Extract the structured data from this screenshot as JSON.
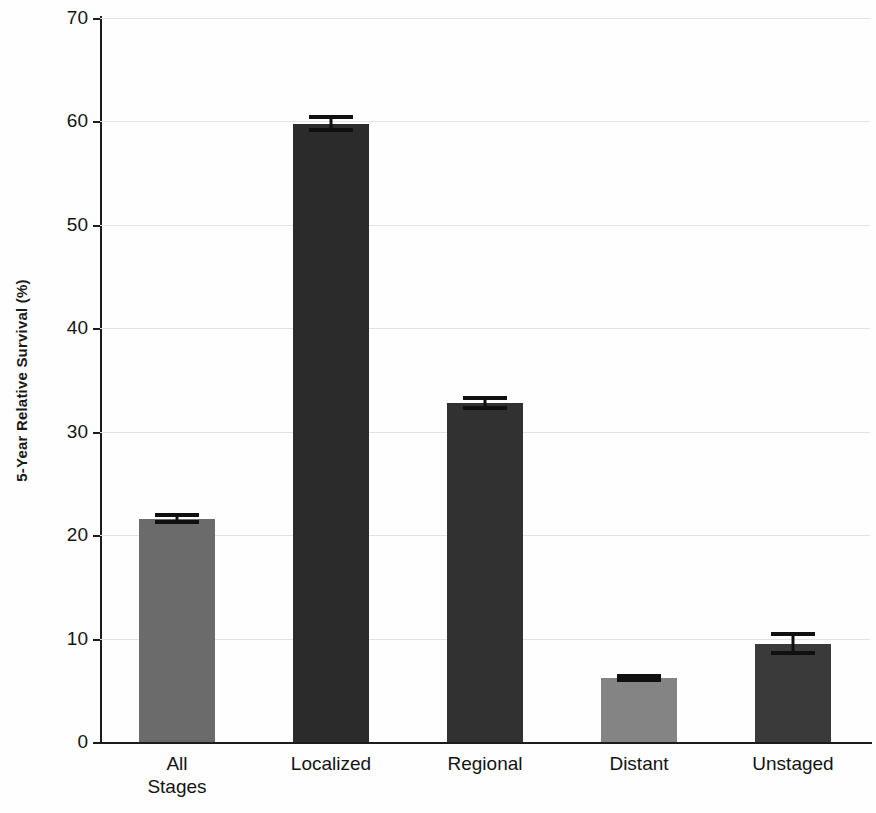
{
  "chart_data": {
    "type": "bar",
    "title": "",
    "subtitle": "",
    "xlabel": "",
    "ylabel": "5-Year Relative Survival (%)",
    "categories": [
      "All\nStages",
      "Localized",
      "Regional",
      "Distant",
      "Unstaged"
    ],
    "values": [
      21.6,
      59.8,
      32.8,
      6.2,
      9.5
    ],
    "errors": [
      0.3,
      0.6,
      0.5,
      0.2,
      0.9
    ],
    "bar_colors": [
      "#6b6b6b",
      "#2b2b2b",
      "#313131",
      "#848484",
      "#3a3a3a"
    ],
    "error_bar_color": "#101010",
    "ylim": [
      0,
      70
    ],
    "yticks": [
      0,
      10,
      20,
      30,
      40,
      50,
      60,
      70
    ],
    "ytick_labels": [
      "0",
      "10",
      "20",
      "30",
      "40",
      "50",
      "60",
      "70"
    ],
    "grid": true,
    "grid_axis": "y",
    "grid_color": "#e3e3e3",
    "legend": false,
    "legend_position": "none",
    "axis_color": "#1c1c1c",
    "background": "#ffffff"
  }
}
